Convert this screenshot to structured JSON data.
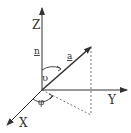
{
  "diagram": {
    "title": "",
    "type": "3D coordinate system with vector and spherical angles",
    "colors": {
      "line": "#333333",
      "dashed": "#555555",
      "background": "#ffffff"
    },
    "origin": [
      42,
      90
    ],
    "axes": [
      {
        "name": "Z",
        "label": "Z",
        "from": [
          42,
          90
        ],
        "to": [
          42,
          8
        ]
      },
      {
        "name": "Y",
        "label": "Y",
        "from": [
          42,
          90
        ],
        "to": [
          127,
          90
        ]
      },
      {
        "name": "X",
        "label": "X",
        "from": [
          42,
          90
        ],
        "to": [
          7,
          125
        ]
      }
    ],
    "vectors": [
      {
        "name": "a",
        "label": "a",
        "from": [
          42,
          90
        ],
        "to": [
          91,
          47
        ]
      }
    ],
    "normal_label": "n",
    "angles": [
      {
        "name": "theta",
        "label": "υ",
        "between": [
          "Z",
          "a"
        ]
      },
      {
        "name": "phi",
        "label": "φ",
        "between": [
          "X",
          "projection"
        ]
      }
    ],
    "projection_lines": [
      {
        "from": [
          91,
          47
        ],
        "to": [
          91,
          115
        ],
        "style": "dashed"
      },
      {
        "from": [
          42,
          90
        ],
        "to": [
          91,
          115
        ],
        "style": "dashed"
      }
    ]
  }
}
